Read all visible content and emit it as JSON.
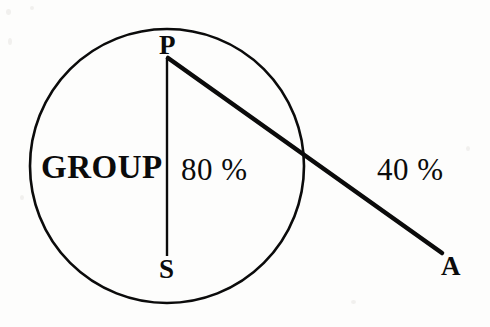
{
  "figure": {
    "type": "geometry-diagram",
    "background_color": "#fdfdfc",
    "ink_color": "#0b0b0b",
    "canvas": {
      "width": 490,
      "height": 327
    },
    "circle": {
      "name": "group-circle",
      "center_x": 167,
      "center_y": 166,
      "radius": 137,
      "stroke_width": 2.6
    },
    "segments": [
      {
        "name": "chord-p-s",
        "from": "P",
        "to": "S",
        "x1": 167,
        "y1": 58,
        "x2": 167,
        "y2": 256,
        "stroke_width": 2.4
      },
      {
        "name": "secant-p-a",
        "from": "P",
        "to": "A",
        "x1": 168,
        "y1": 58,
        "x2": 442,
        "y2": 253,
        "stroke_width": 4.6
      }
    ],
    "points": [
      {
        "id": "point-p",
        "label": "P",
        "x": 159,
        "y": 32
      },
      {
        "id": "point-s",
        "label": "S",
        "x": 159,
        "y": 256
      },
      {
        "id": "point-a",
        "label": "A",
        "x": 441,
        "y": 253
      }
    ],
    "annotations": [
      {
        "id": "group-label",
        "text": "GROUP",
        "x": 41,
        "y": 151
      },
      {
        "id": "inner-percent",
        "text": "80 %",
        "x": 181,
        "y": 154
      },
      {
        "id": "outer-percent",
        "text": "40 %",
        "x": 377,
        "y": 154
      }
    ]
  }
}
